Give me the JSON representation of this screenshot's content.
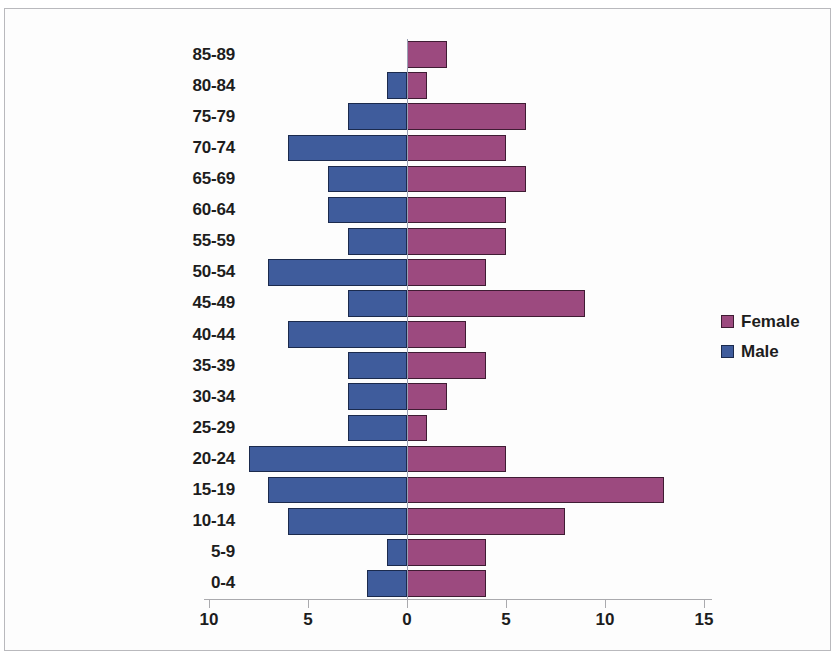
{
  "chart_data": {
    "type": "bar",
    "subtype": "population-pyramid",
    "title": "",
    "xlabel": "",
    "ylabel": "",
    "grid": false,
    "legend_position": "right",
    "orientation": "horizontal",
    "categories": [
      "0-4",
      "5-9",
      "10-14",
      "15-19",
      "20-24",
      "25-29",
      "30-34",
      "35-39",
      "40-44",
      "45-49",
      "50-54",
      "55-59",
      "60-64",
      "65-69",
      "70-74",
      "75-79",
      "80-84",
      "85-89"
    ],
    "series": [
      {
        "name": "Male",
        "color": "#3f5c9c",
        "direction": "left",
        "values": [
          2,
          1,
          6,
          7,
          8,
          3,
          3,
          3,
          6,
          3,
          7,
          3,
          4,
          4,
          6,
          3,
          1,
          0
        ]
      },
      {
        "name": "Female",
        "color": "#9c4a7f",
        "direction": "right",
        "values": [
          4,
          4,
          8,
          13,
          5,
          1,
          2,
          4,
          3,
          9,
          4,
          5,
          5,
          6,
          5,
          6,
          1,
          2
        ]
      }
    ],
    "x_ticks": [
      {
        "label": "10",
        "value": -10
      },
      {
        "label": "5",
        "value": -5
      },
      {
        "label": "0",
        "value": 0
      },
      {
        "label": "5",
        "value": 5
      },
      {
        "label": "10",
        "value": 10
      },
      {
        "label": "15",
        "value": 15
      }
    ],
    "xlim": [
      -10,
      15
    ]
  },
  "legend": {
    "entries": [
      {
        "label": "Female",
        "color": "#9c4a7f"
      },
      {
        "label": "Male",
        "color": "#3f5c9c"
      }
    ]
  }
}
